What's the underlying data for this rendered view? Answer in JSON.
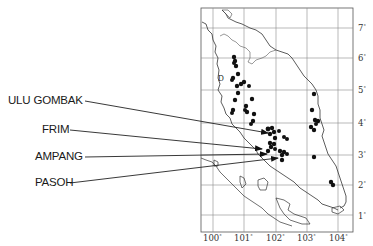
{
  "map": {
    "region": "Peninsular Malaysia",
    "frame": {
      "left": 201,
      "top": 8,
      "right": 353,
      "bottom": 232
    },
    "longitude_ticks": [
      {
        "label": "100",
        "x": 213
      },
      {
        "label": "101",
        "x": 244
      },
      {
        "label": "102",
        "x": 276
      },
      {
        "label": "103",
        "x": 307
      },
      {
        "label": "104",
        "x": 338
      }
    ],
    "latitude_ticks": [
      {
        "label": "7",
        "y": 28
      },
      {
        "label": "6",
        "y": 58
      },
      {
        "label": "5",
        "y": 90
      },
      {
        "label": "4",
        "y": 123
      },
      {
        "label": "3",
        "y": 155
      },
      {
        "label": "2",
        "y": 185
      },
      {
        "label": "1",
        "y": 215
      }
    ],
    "degree_symbol": "°",
    "inset_marker": "D",
    "sites": [
      {
        "name": "ULU GOMBAK",
        "label_x": 8,
        "label_y": 94,
        "line_from": [
          85,
          101
        ],
        "line_to": [
          268,
          133
        ]
      },
      {
        "name": "FRIM",
        "label_x": 42,
        "label_y": 123,
        "line_from": [
          70,
          130
        ],
        "line_to": [
          262,
          149
        ]
      },
      {
        "name": "AMPANG",
        "label_x": 35,
        "label_y": 150,
        "line_from": [
          85,
          157
        ],
        "line_to": [
          267,
          154
        ]
      },
      {
        "name": "PASOH",
        "label_x": 35,
        "label_y": 176,
        "line_from": [
          70,
          183
        ],
        "line_to": [
          278,
          158
        ]
      }
    ],
    "colors": {
      "ink": "#1a1a1a",
      "grid": "#888888",
      "coast": "#333333",
      "dot": "#111111"
    }
  }
}
